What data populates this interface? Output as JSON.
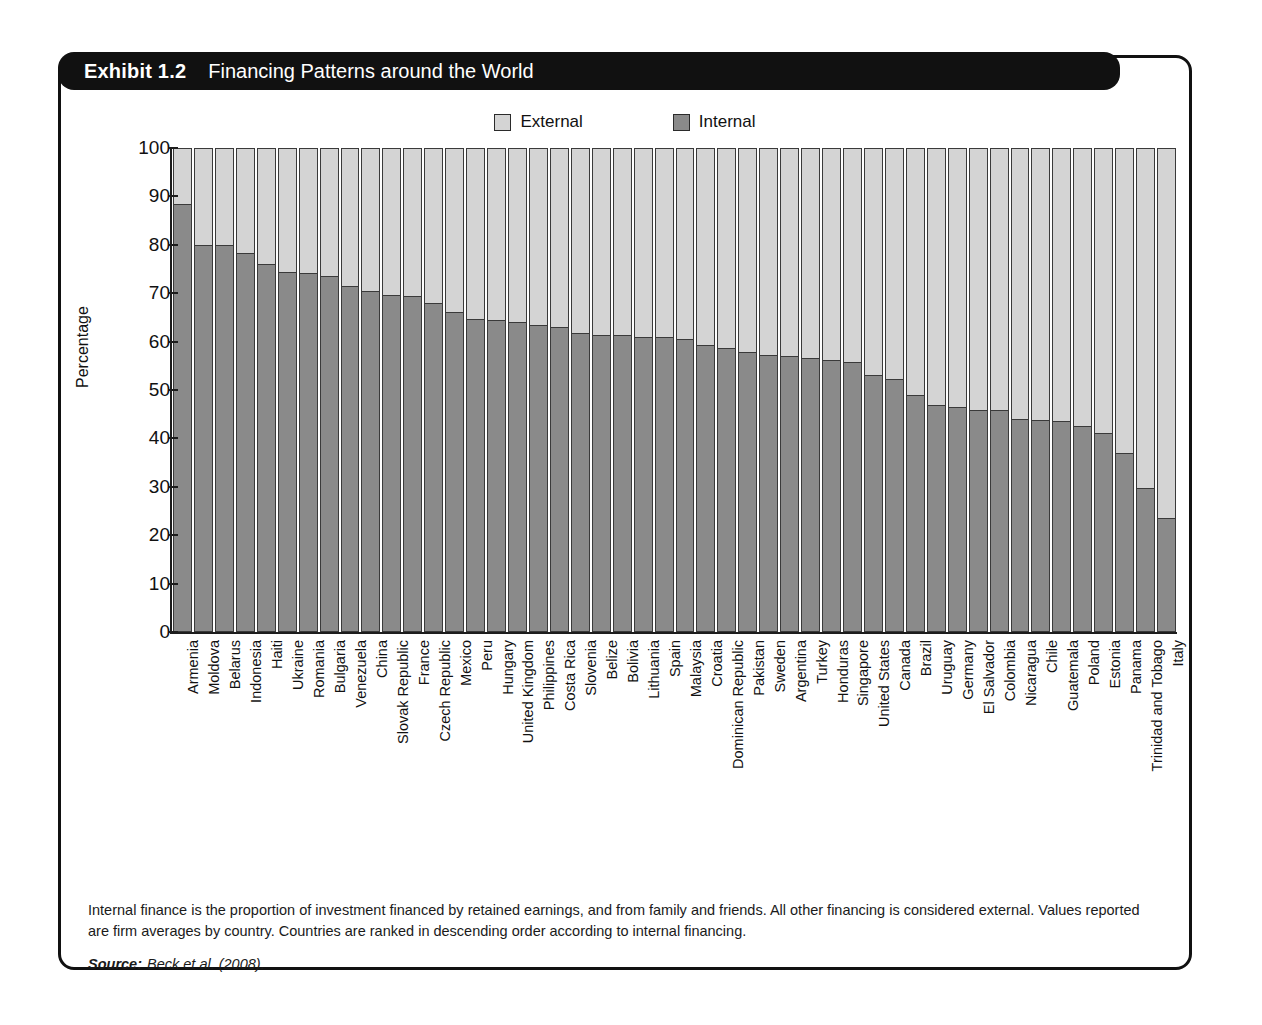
{
  "exhibit": {
    "number_label": "Exhibit 1.2",
    "title": "Financing Patterns around the World"
  },
  "legend": {
    "position": "top-center",
    "items": [
      {
        "label": "External",
        "color": "#d4d4d4",
        "icon": "legend-swatch-external"
      },
      {
        "label": "Internal",
        "color": "#8a8a8a",
        "icon": "legend-swatch-internal"
      }
    ]
  },
  "notes": {
    "body": "Internal finance is the proportion of investment financed by retained earnings, and from family and friends. All other financing is considered external. Values reported are firm averages by country. Countries are ranked in descending order according to internal financing.",
    "source_label": "Source:",
    "source_value": "Beck et al. (2008)."
  },
  "chart_data": {
    "type": "bar",
    "subtype": "stacked-column-100",
    "title": "Financing Patterns around the World",
    "xlabel": "",
    "ylabel": "Percentage",
    "ylim": [
      0,
      100
    ],
    "yticks": [
      0,
      10,
      20,
      30,
      40,
      50,
      60,
      70,
      80,
      90,
      100
    ],
    "grid": false,
    "legend_position": "top-center",
    "categories": [
      "Armenia",
      "Moldova",
      "Belarus",
      "Indonesia",
      "Haiti",
      "Ukraine",
      "Romania",
      "Bulgaria",
      "Venezuela",
      "China",
      "Slovak Republic",
      "France",
      "Czech Republic",
      "Mexico",
      "Peru",
      "Hungary",
      "United Kingdom",
      "Philippines",
      "Costa Rica",
      "Slovenia",
      "Belize",
      "Bolivia",
      "Lithuania",
      "Spain",
      "Malaysia",
      "Croatia",
      "Dominican Republic",
      "Pakistan",
      "Sweden",
      "Argentina",
      "Turkey",
      "Honduras",
      "Singapore",
      "United States",
      "Canada",
      "Brazil",
      "Uruguay",
      "Germany",
      "El Salvador",
      "Colombia",
      "Nicaragua",
      "Chile",
      "Guatemala",
      "Poland",
      "Estonia",
      "Panama",
      "Trinidad and Tobago",
      "Italy"
    ],
    "series": [
      {
        "name": "Internal",
        "color": "#8a8a8a",
        "values": [
          88.5,
          80.0,
          80.0,
          78.3,
          76.0,
          74.3,
          74.2,
          73.6,
          71.5,
          70.5,
          69.6,
          69.4,
          67.9,
          66.1,
          64.6,
          64.4,
          64.1,
          63.4,
          63.0,
          61.8,
          61.4,
          61.4,
          60.9,
          60.9,
          60.5,
          59.2,
          58.6,
          57.8,
          57.2,
          57.1,
          56.6,
          56.2,
          55.7,
          53.2,
          52.3,
          49.0,
          46.9,
          46.5,
          45.9,
          45.9,
          44.0,
          43.8,
          43.7,
          42.5,
          41.1,
          37.0,
          29.8,
          23.5
        ]
      },
      {
        "name": "External",
        "color": "#d4d4d4",
        "values": [
          11.5,
          20.0,
          20.0,
          21.7,
          24.0,
          25.7,
          25.8,
          26.4,
          28.5,
          29.5,
          30.4,
          30.6,
          32.1,
          33.9,
          35.4,
          35.6,
          35.9,
          36.6,
          37.0,
          38.2,
          38.6,
          38.6,
          39.1,
          39.1,
          39.5,
          40.8,
          41.4,
          42.2,
          42.8,
          42.9,
          43.4,
          43.8,
          44.3,
          46.8,
          47.7,
          51.0,
          53.1,
          53.5,
          54.1,
          54.1,
          56.0,
          56.2,
          56.3,
          57.5,
          58.9,
          63.0,
          70.2,
          76.5
        ]
      }
    ]
  }
}
